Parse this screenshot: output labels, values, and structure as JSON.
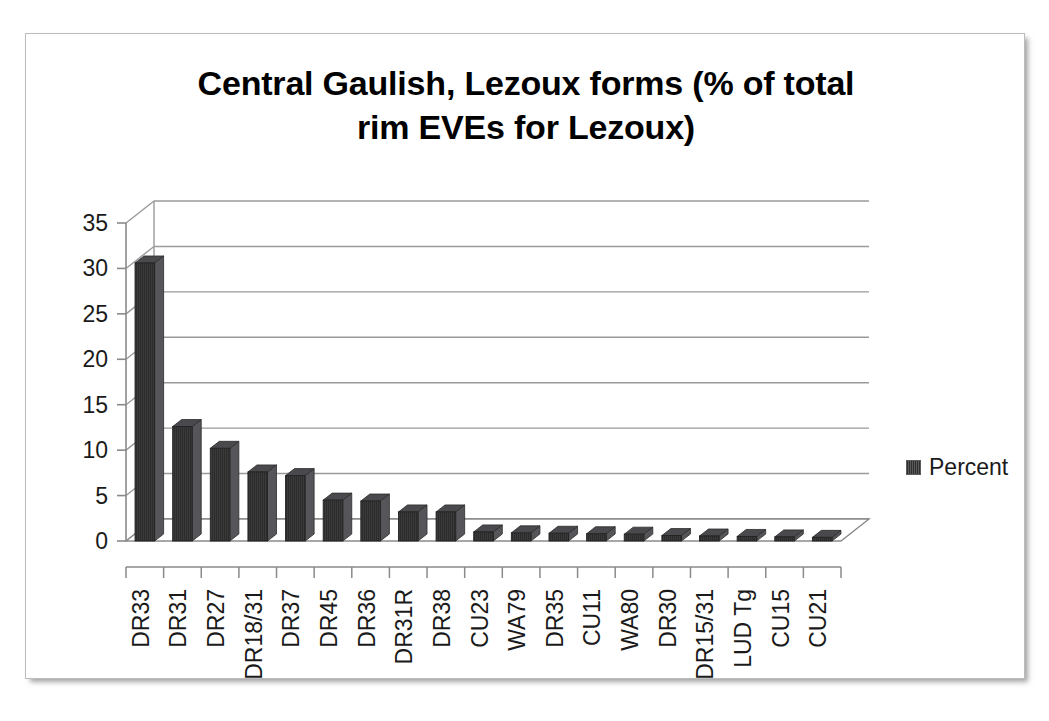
{
  "chart_data": {
    "type": "bar",
    "title": "Central Gaulish, Lezoux forms (% of total rim EVEs for Lezoux)",
    "title_line1": "Central Gaulish, Lezoux forms (% of total",
    "title_line2": "rim EVEs for Lezoux)",
    "xlabel": "",
    "ylabel": "",
    "ylim": [
      0,
      35
    ],
    "yticks": [
      0,
      5,
      10,
      15,
      20,
      25,
      30,
      35
    ],
    "ytick_labels": [
      "0",
      "5",
      "10",
      "15",
      "20",
      "25",
      "30",
      "35"
    ],
    "grid": true,
    "grid_axis": "y",
    "legend": [
      "Percent"
    ],
    "legend_position": "right",
    "series_name": "Percent",
    "bar_color": "#3a3a3a",
    "categories": [
      "DR33",
      "DR31",
      "DR27",
      "DR18/31",
      "DR37",
      "DR45",
      "DR36",
      "DR31R",
      "DR38",
      "CU23",
      "WA79",
      "DR35",
      "CU11",
      "WA80",
      "DR30",
      "DR15/31",
      "LUD Tg",
      "CU15",
      "CU21"
    ],
    "values": [
      30.6,
      12.6,
      10.2,
      7.6,
      7.2,
      4.5,
      4.4,
      3.2,
      3.2,
      1.0,
      0.9,
      0.85,
      0.8,
      0.75,
      0.6,
      0.55,
      0.5,
      0.45,
      0.4
    ]
  },
  "legend": {
    "label": "Percent",
    "swatch_name": "percent-series-swatch"
  }
}
